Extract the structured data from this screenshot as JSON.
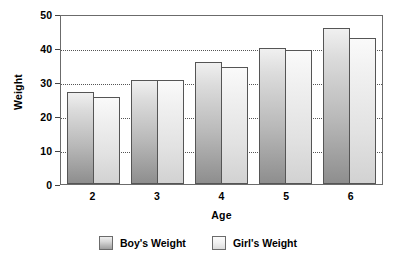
{
  "chart_data": {
    "type": "bar",
    "title": "",
    "xlabel": "Age",
    "ylabel": "Weight",
    "categories": [
      "2",
      "3",
      "4",
      "5",
      "6"
    ],
    "series": [
      {
        "name": "Boy's Weight",
        "values": [
          27,
          30.5,
          36,
          40,
          46
        ],
        "color": "#b9b9b9"
      },
      {
        "name": "Girl's Weight",
        "values": [
          25.5,
          30.5,
          34.5,
          39.5,
          43
        ],
        "color": "#e2e2e2"
      }
    ],
    "ylim": [
      0,
      50
    ],
    "yticks": [
      0,
      10,
      20,
      30,
      40,
      50
    ],
    "ytick_labels": [
      "0",
      "10",
      "20",
      "30",
      "40",
      "50"
    ],
    "grid": true,
    "grid_axis": "y",
    "legend_position": "bottom"
  },
  "axes": {
    "y_title": "Weight",
    "x_title": "Age"
  }
}
